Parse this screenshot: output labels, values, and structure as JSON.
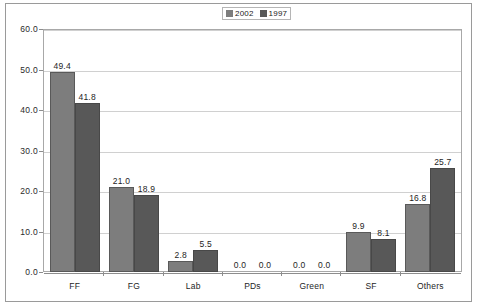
{
  "chart_data": {
    "type": "bar",
    "title": "",
    "subtitle": "",
    "xlabel": "",
    "ylabel": "",
    "ylim": [
      0.0,
      60.0
    ],
    "ytick_step": 10.0,
    "yticks": [
      "60.0",
      "50.0",
      "40.0",
      "30.0",
      "20.0",
      "10.0",
      "0.0"
    ],
    "ytick_values": [
      60.0,
      50.0,
      40.0,
      30.0,
      20.0,
      10.0,
      0.0
    ],
    "grid": true,
    "grid_axis": "y",
    "legend_position": "top-center",
    "categories": [
      "FF",
      "FG",
      "Lab",
      "PDs",
      "Green",
      "SF",
      "Others"
    ],
    "series": [
      {
        "name": "2002",
        "color": "#7d7d7d",
        "values": [
          49.4,
          21.0,
          2.8,
          0.0,
          0.0,
          9.9,
          16.8
        ],
        "labels": [
          "49.4",
          "21.0",
          "2.8",
          "0.0",
          "0.0",
          "9.9",
          "16.8"
        ]
      },
      {
        "name": "1997",
        "color": "#585858",
        "values": [
          41.8,
          18.9,
          5.5,
          0.0,
          0.0,
          8.1,
          25.7
        ],
        "labels": [
          "41.8",
          "18.9",
          "5.5",
          "0.0",
          "0.0",
          "8.1",
          "25.7"
        ]
      }
    ]
  },
  "legend": {
    "entries": [
      {
        "label": "2002",
        "color": "#7d7d7d"
      },
      {
        "label": "1997",
        "color": "#585858"
      }
    ]
  },
  "colors": {
    "series_2002": "#7d7d7d",
    "series_1997": "#585858",
    "gridline": "#d0d0d0",
    "axis": "#8d8d8d",
    "frame": "#9a9a9a",
    "background": "#ffffff",
    "text": "#1e1e1e"
  }
}
